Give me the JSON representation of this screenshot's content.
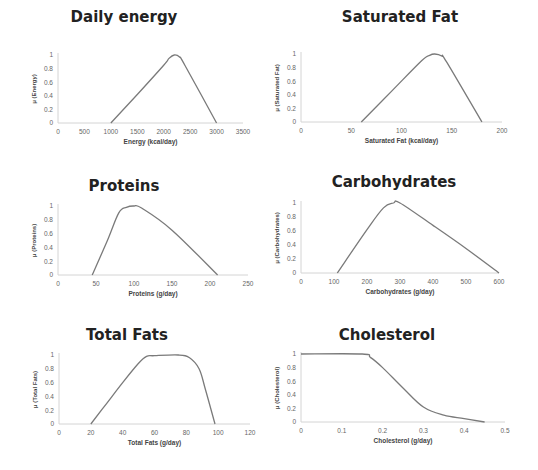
{
  "chart_data": [
    {
      "id": "energy",
      "type": "line",
      "title": "Daily energy",
      "xlabel": "Energy (kcal/day)",
      "ylabel": "μ (Energy)",
      "xlim": [
        0,
        3500
      ],
      "ylim": [
        0,
        1
      ],
      "xticks": [
        0,
        500,
        1000,
        1500,
        2000,
        2500,
        3000,
        3500
      ],
      "yticks": [
        0,
        0.2,
        0.4,
        0.6,
        0.8,
        1
      ],
      "grid": false,
      "x": [
        1000,
        1500,
        2000,
        2100,
        2200,
        2300,
        2400,
        3000
      ],
      "y": [
        0,
        0.42,
        0.85,
        0.95,
        1.0,
        0.97,
        0.85,
        0
      ],
      "layout": {
        "title_x": 124,
        "title_y": 8,
        "x0": 58,
        "x1": 243,
        "yTop": 55,
        "yBot": 123
      }
    },
    {
      "id": "saturated-fat",
      "type": "line",
      "title": "Saturated Fat",
      "xlabel": "Saturated Fat (kcal/day)",
      "ylabel": "μ (Saturated Fat)",
      "xlim": [
        0,
        200
      ],
      "ylim": [
        0,
        1
      ],
      "xticks": [
        0,
        50,
        100,
        150,
        200
      ],
      "yticks": [
        0,
        0.2,
        0.4,
        0.6,
        0.8,
        1
      ],
      "grid": false,
      "x": [
        60,
        90,
        120,
        128,
        133,
        140,
        145,
        180
      ],
      "y": [
        0,
        0.45,
        0.9,
        0.98,
        1.0,
        0.97,
        0.88,
        0
      ],
      "layout": {
        "title_x": 400,
        "title_y": 8,
        "x0": 301,
        "x1": 502,
        "yTop": 54,
        "yBot": 122
      }
    },
    {
      "id": "proteins",
      "type": "line",
      "title": "Proteins",
      "xlabel": "Proteins (g/day)",
      "ylabel": "μ (Proteins)",
      "xlim": [
        0,
        250
      ],
      "ylim": [
        0,
        1
      ],
      "xticks": [
        0,
        50,
        100,
        150,
        200,
        250
      ],
      "yticks": [
        0,
        0.2,
        0.4,
        0.6,
        0.8,
        1
      ],
      "grid": false,
      "x": [
        45,
        65,
        80,
        90,
        100,
        110,
        150,
        210
      ],
      "y": [
        0,
        0.5,
        0.9,
        0.98,
        1.0,
        0.97,
        0.65,
        0
      ],
      "layout": {
        "title_x": 124,
        "title_y": 177,
        "x0": 58,
        "x1": 248,
        "yTop": 206,
        "yBot": 275
      }
    },
    {
      "id": "carbohydrates",
      "type": "line",
      "title": "Carbohydrates",
      "xlabel": "Carbohydrates (g/day)",
      "ylabel": "μ (Carbohydrates)",
      "xlim": [
        0,
        600
      ],
      "ylim": [
        0,
        1
      ],
      "xticks": [
        0,
        100,
        200,
        300,
        400,
        500,
        600
      ],
      "yticks": [
        0,
        0.2,
        0.4,
        0.6,
        0.8,
        1
      ],
      "grid": false,
      "x": [
        110,
        200,
        250,
        280,
        300,
        400,
        500,
        600
      ],
      "y": [
        0,
        0.62,
        0.93,
        1.0,
        1.0,
        0.68,
        0.35,
        0
      ],
      "layout": {
        "title_x": 394,
        "title_y": 173,
        "x0": 301,
        "x1": 499,
        "yTop": 203,
        "yBot": 273
      }
    },
    {
      "id": "total-fats",
      "type": "line",
      "title": "Total Fats",
      "xlabel": "Total Fats (g/day)",
      "ylabel": "μ (Total Fats)",
      "xlim": [
        0,
        120
      ],
      "ylim": [
        0,
        1
      ],
      "xticks": [
        0,
        20,
        40,
        60,
        80,
        100,
        120
      ],
      "yticks": [
        0,
        0.2,
        0.4,
        0.6,
        0.8,
        1
      ],
      "grid": false,
      "x": [
        20,
        30,
        40,
        50,
        55,
        60,
        75,
        82,
        88,
        92,
        98
      ],
      "y": [
        0,
        0.3,
        0.6,
        0.88,
        0.98,
        0.99,
        1.0,
        0.96,
        0.8,
        0.5,
        0
      ],
      "layout": {
        "title_x": 127,
        "title_y": 326,
        "x0": 59,
        "x1": 250,
        "yTop": 355,
        "yBot": 424
      }
    },
    {
      "id": "cholesterol",
      "type": "line",
      "title": "Cholesterol",
      "xlabel": "Cholesterol (g/day)",
      "ylabel": "μ (Cholesterol)",
      "xlim": [
        0,
        0.5
      ],
      "ylim": [
        0,
        1
      ],
      "xticks": [
        0,
        0.1,
        0.2,
        0.3,
        0.4,
        0.5
      ],
      "yticks": [
        0,
        0.2,
        0.4,
        0.6,
        0.8,
        1
      ],
      "grid": false,
      "x": [
        0,
        0.15,
        0.17,
        0.2,
        0.25,
        0.3,
        0.35,
        0.4,
        0.45
      ],
      "y": [
        1,
        1,
        0.95,
        0.8,
        0.5,
        0.22,
        0.1,
        0.05,
        0
      ],
      "layout": {
        "title_x": 387,
        "title_y": 326,
        "x0": 301,
        "x1": 505,
        "yTop": 354,
        "yBot": 422
      }
    }
  ]
}
